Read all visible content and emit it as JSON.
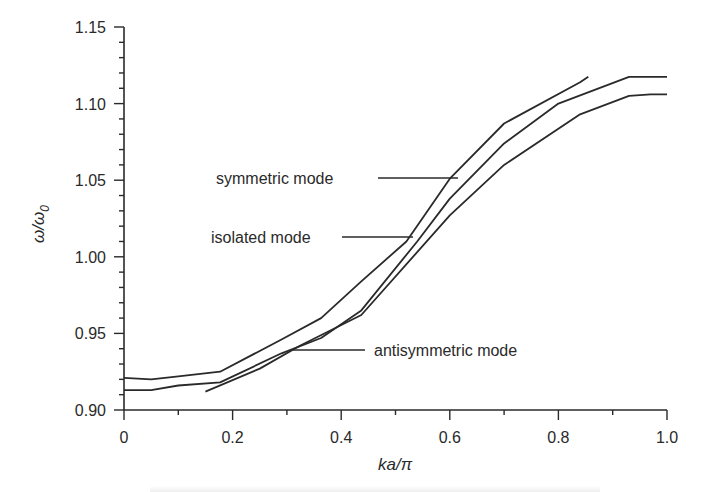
{
  "chart_data": {
    "type": "line",
    "title": "",
    "xlabel": "ka/π",
    "ylabel": "ω/ω0",
    "xlim": [
      0,
      1.0
    ],
    "ylim": [
      0.9,
      1.15
    ],
    "x_ticks": [
      "0",
      "0.2",
      "0.4",
      "0.6",
      "0.8",
      "1.0"
    ],
    "x_tick_values": [
      0,
      0.2,
      0.4,
      0.6,
      0.8,
      1.0
    ],
    "x_minor_step": 0.1,
    "y_ticks": [
      "0.90",
      "0.95",
      "1.00",
      "1.05",
      "1.10",
      "1.15"
    ],
    "y_tick_values": [
      0.9,
      0.95,
      1.0,
      1.05,
      1.1,
      1.15
    ],
    "y_minor_step": 0.01,
    "grid": false,
    "legend": "inline annotations with leader lines",
    "series": [
      {
        "name": "symmetric mode",
        "x": [
          0,
          0.05,
          0.1,
          0.177,
          0.29,
          0.363,
          0.437,
          0.52,
          0.6,
          0.7,
          0.84,
          0.855
        ],
        "values": [
          0.921,
          0.92,
          0.922,
          0.925,
          0.946,
          0.96,
          0.984,
          1.01,
          1.051,
          1.087,
          1.114,
          1.1175
        ]
      },
      {
        "name": "isolated mode",
        "x": [
          0,
          0.05,
          0.1,
          0.177,
          0.29,
          0.363,
          0.437,
          0.54,
          0.6,
          0.7,
          0.8,
          0.93,
          1.0
        ],
        "values": [
          0.913,
          0.913,
          0.916,
          0.918,
          0.937,
          0.947,
          0.965,
          1.01,
          1.038,
          1.074,
          1.1,
          1.1175,
          1.1175
        ]
      },
      {
        "name": "antisymmetric mode",
        "x": [
          0.15,
          0.25,
          0.324,
          0.437,
          0.6,
          0.7,
          0.84,
          0.93,
          0.97,
          1.0
        ],
        "values": [
          0.912,
          0.927,
          0.942,
          0.962,
          1.027,
          1.06,
          1.093,
          1.105,
          1.106,
          1.106
        ]
      }
    ],
    "annotations": [
      {
        "text": "symmetric mode",
        "label_x_px": 216,
        "label_y_px": 184,
        "line_from_px": [
          378,
          178
        ],
        "line_to_px": [
          458,
          178
        ]
      },
      {
        "text": "isolated mode",
        "label_x_px": 211,
        "label_y_px": 243,
        "line_from_px": [
          342,
          237
        ],
        "line_to_px": [
          413,
          237
        ]
      },
      {
        "text": "antisymmetric mode",
        "label_x_px": 374,
        "label_y_px": 356,
        "line_from_px": [
          293,
          350
        ],
        "line_to_px": [
          365,
          350
        ]
      }
    ]
  },
  "axes": {
    "x_title_main": "ka",
    "x_title_sep": "/π",
    "y_title_main": "ω/ω",
    "y_title_sub": "0"
  },
  "colors": {
    "line": "#2a2a2a",
    "text": "#2a2a2a",
    "background": "#ffffff"
  }
}
